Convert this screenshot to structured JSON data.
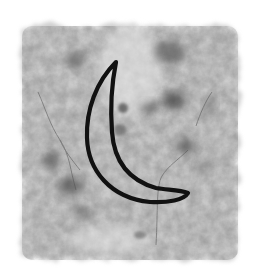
{
  "image": {
    "subject": "crescent moon outline on grunge texture",
    "icon": "crescent-moon-icon",
    "colors": {
      "background": "#ffffff",
      "texture_light": "#d2d2d2",
      "texture_mid": "#9a9a9a",
      "texture_dark": "#4a4a4a",
      "stroke": "#111111"
    }
  }
}
